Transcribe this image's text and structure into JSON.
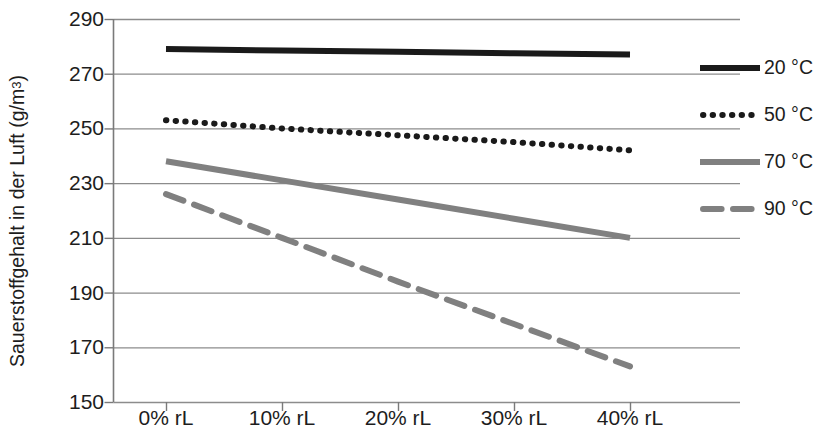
{
  "chart_data": {
    "type": "line",
    "title": "",
    "xlabel": "",
    "ylabel": "Sauerstoffgehalt in der Luft (g/m³)",
    "ylabel_parts": {
      "main": "Sauerstoffgehalt in der Luft (g/m",
      "sup": "3",
      "tail": ")"
    },
    "categories": [
      "0% rL",
      "10% rL",
      "20% rL",
      "30% rL",
      "40% rL"
    ],
    "x": [
      0,
      10,
      20,
      30,
      40
    ],
    "ylim": [
      150,
      290
    ],
    "yticks": [
      290,
      270,
      250,
      230,
      210,
      190,
      170,
      150
    ],
    "ytick_labels": [
      "290",
      "270",
      "250",
      "230",
      "210",
      "190",
      "170",
      "150"
    ],
    "grid": true,
    "grid_axis": "y",
    "legend_position": "right",
    "series": [
      {
        "name": "20 °C",
        "style": "solid",
        "color": "#1a1a1a",
        "width": 6,
        "values": [
          279,
          278.5,
          278,
          277.5,
          277
        ]
      },
      {
        "name": "50 °C",
        "style": "dotted",
        "color": "#1a1a1a",
        "width": 6,
        "values": [
          253,
          250,
          247.5,
          245,
          242
        ]
      },
      {
        "name": "70 °C",
        "style": "solid",
        "color": "#808080",
        "width": 6,
        "values": [
          238,
          231,
          224,
          217,
          210
        ]
      },
      {
        "name": "90 °C",
        "style": "dashed",
        "color": "#808080",
        "width": 6,
        "values": [
          226,
          210,
          194,
          178.5,
          163
        ]
      }
    ]
  },
  "legend": {
    "items": [
      {
        "label": "20 °C",
        "style": "solid",
        "color": "#1a1a1a"
      },
      {
        "label": "50 °C",
        "style": "dotted",
        "color": "#1a1a1a"
      },
      {
        "label": "70 °C",
        "style": "solid",
        "color": "#808080"
      },
      {
        "label": "90 °C",
        "style": "dashed",
        "color": "#808080"
      }
    ]
  },
  "colors": {
    "axis": "#7a7a7a",
    "grid": "#8c8c8c",
    "text": "#1d1d1d",
    "series_dark": "#1a1a1a",
    "series_gray": "#808080",
    "background": "#ffffff"
  }
}
